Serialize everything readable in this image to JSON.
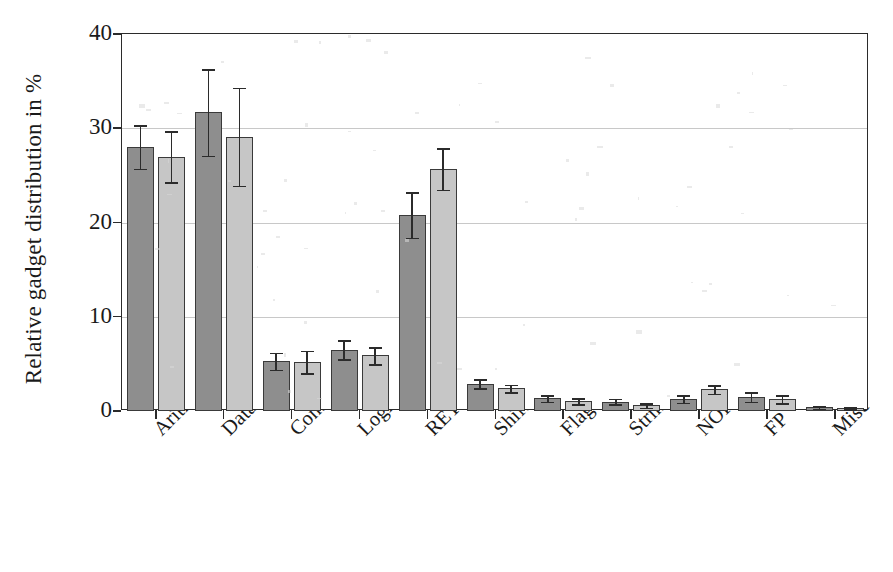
{
  "chart_data": {
    "type": "bar",
    "title": "",
    "xlabel": "",
    "ylabel": "Relative gadget distribution in %",
    "ylim": [
      0,
      40
    ],
    "yticks": [
      0,
      10,
      20,
      30,
      40
    ],
    "ytick_labels": [
      "0",
      "10",
      "20",
      "30",
      "40"
    ],
    "grid": true,
    "legend": "none",
    "categories": [
      "Arithmetic",
      "Data-Move",
      "Control-Flow",
      "Logic",
      "RETs",
      "Shift/Rot",
      "Flag",
      "String",
      "NOP",
      "FP",
      "Misc"
    ],
    "series": [
      {
        "name": "series-1",
        "color": "#8e8e8e",
        "values": [
          28.0,
          31.7,
          5.3,
          6.5,
          20.8,
          2.9,
          1.35,
          1.0,
          1.3,
          1.5,
          0.4
        ],
        "errors": [
          2.3,
          4.6,
          0.9,
          1.0,
          2.4,
          0.45,
          0.35,
          0.3,
          0.4,
          0.5,
          0.15
        ]
      },
      {
        "name": "series-2",
        "color": "#c6c6c6",
        "values": [
          27.0,
          29.1,
          5.2,
          5.9,
          25.7,
          2.4,
          1.05,
          0.6,
          2.3,
          1.25,
          0.3
        ],
        "errors": [
          2.7,
          5.2,
          1.2,
          0.9,
          2.2,
          0.4,
          0.3,
          0.25,
          0.45,
          0.4,
          0.12
        ]
      }
    ]
  },
  "axis": {
    "ylabel": "Relative gadget distribution in %"
  }
}
